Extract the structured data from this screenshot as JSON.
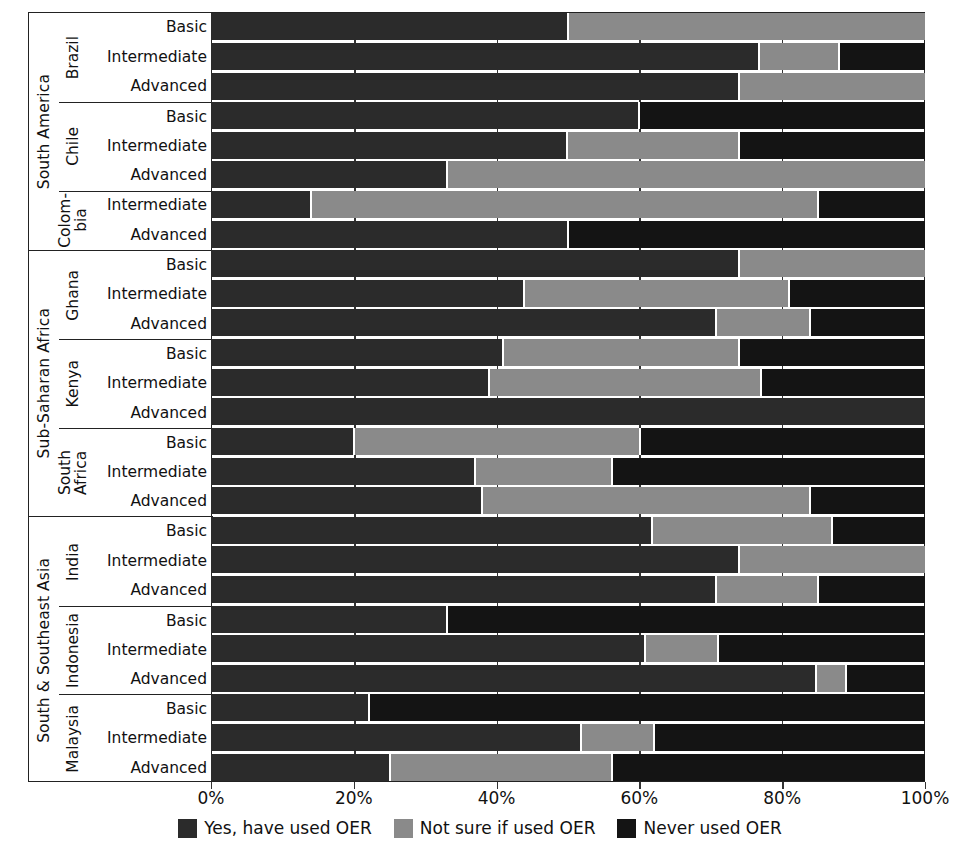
{
  "chart_data": {
    "type": "bar",
    "orientation": "horizontal",
    "stacked": true,
    "title": "",
    "xlabel": "",
    "ylabel": "",
    "xlim": [
      0,
      100
    ],
    "grid": true,
    "legend_position": "bottom",
    "xticks": [
      "0%",
      "20%",
      "40%",
      "60%",
      "80%",
      "100%"
    ],
    "xtick_values": [
      0,
      20,
      40,
      60,
      80,
      100
    ],
    "series": [
      {
        "name": "Yes, have used OER",
        "color": "#2b2b2b"
      },
      {
        "name": "Not sure if used OER",
        "color": "#8a8a8a"
      },
      {
        "name": "Never used OER",
        "color": "#141414"
      }
    ],
    "categories": [
      "Basic",
      "Intermediate",
      "Advanced"
    ],
    "regions": [
      {
        "region": "South America",
        "countries": [
          {
            "country": "Brazil",
            "country_display": "Brazil",
            "rows": [
              {
                "level": "Basic",
                "values": [
                  50,
                  50,
                  0
                ]
              },
              {
                "level": "Intermediate",
                "values": [
                  77,
                  11,
                  12
                ]
              },
              {
                "level": "Advanced",
                "values": [
                  74,
                  26,
                  0
                ]
              }
            ]
          },
          {
            "country": "Chile",
            "country_display": "Chile",
            "rows": [
              {
                "level": "Basic",
                "values": [
                  60,
                  0,
                  40
                ]
              },
              {
                "level": "Intermediate",
                "values": [
                  50,
                  24,
                  26
                ]
              },
              {
                "level": "Advanced",
                "values": [
                  33,
                  67,
                  0
                ]
              }
            ]
          },
          {
            "country": "Colombia",
            "country_display": "Colom-\nbia",
            "rows": [
              {
                "level": "Intermediate",
                "values": [
                  14,
                  71,
                  15
                ]
              },
              {
                "level": "Advanced",
                "values": [
                  50,
                  0,
                  50
                ]
              }
            ]
          }
        ]
      },
      {
        "region": "Sub-Saharan Africa",
        "countries": [
          {
            "country": "Ghana",
            "country_display": "Ghana",
            "rows": [
              {
                "level": "Basic",
                "values": [
                  74,
                  26,
                  0
                ]
              },
              {
                "level": "Intermediate",
                "values": [
                  44,
                  37,
                  19
                ]
              },
              {
                "level": "Advanced",
                "values": [
                  71,
                  13,
                  16
                ]
              }
            ]
          },
          {
            "country": "Kenya",
            "country_display": "Kenya",
            "rows": [
              {
                "level": "Basic",
                "values": [
                  41,
                  33,
                  26
                ]
              },
              {
                "level": "Intermediate",
                "values": [
                  39,
                  38,
                  23
                ]
              },
              {
                "level": "Advanced",
                "values": [
                  100,
                  0,
                  0
                ]
              }
            ]
          },
          {
            "country": "South Africa",
            "country_display": "South\nAfrica",
            "rows": [
              {
                "level": "Basic",
                "values": [
                  20,
                  40,
                  40
                ]
              },
              {
                "level": "Intermediate",
                "values": [
                  37,
                  19,
                  44
                ]
              },
              {
                "level": "Advanced",
                "values": [
                  38,
                  46,
                  16
                ]
              }
            ]
          }
        ]
      },
      {
        "region": "South & Southeast Asia",
        "countries": [
          {
            "country": "India",
            "country_display": "India",
            "rows": [
              {
                "level": "Basic",
                "values": [
                  62,
                  25,
                  13
                ]
              },
              {
                "level": "Intermediate",
                "values": [
                  74,
                  26,
                  0
                ]
              },
              {
                "level": "Advanced",
                "values": [
                  71,
                  14,
                  15
                ]
              }
            ]
          },
          {
            "country": "Indonesia",
            "country_display": "Indonesia",
            "rows": [
              {
                "level": "Basic",
                "values": [
                  33,
                  0,
                  67
                ]
              },
              {
                "level": "Intermediate",
                "values": [
                  61,
                  10,
                  29
                ]
              },
              {
                "level": "Advanced",
                "values": [
                  85,
                  4,
                  11
                ]
              }
            ]
          },
          {
            "country": "Malaysia",
            "country_display": "Malaysia",
            "rows": [
              {
                "level": "Basic",
                "values": [
                  22,
                  0,
                  78
                ]
              },
              {
                "level": "Intermediate",
                "values": [
                  52,
                  10,
                  38
                ]
              },
              {
                "level": "Advanced",
                "values": [
                  25,
                  31,
                  44
                ]
              }
            ]
          }
        ]
      }
    ]
  }
}
